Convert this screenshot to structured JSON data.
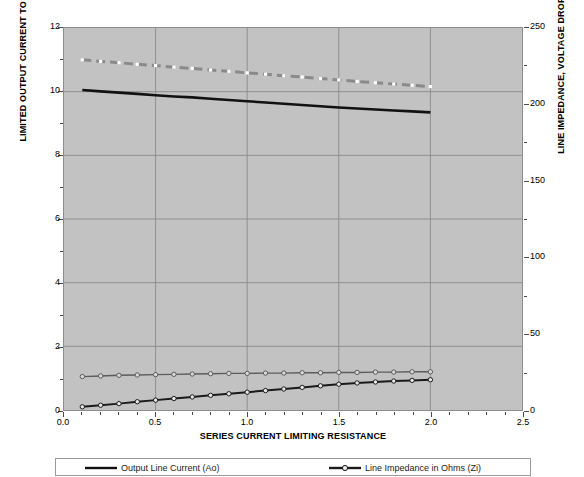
{
  "chart_data": {
    "type": "line",
    "title": "",
    "xlabel": "SERIES CURRENT LIMITING  RESISTANCE",
    "ylabel": "LIMITED OUTPUT CURRENT TO LOAD IN AMPERES",
    "ylabel_right": "LINE IMPEDANCE, VOLTAGE DROP AND LOAD VOLTAGE",
    "xlim": [
      0.0,
      2.5
    ],
    "ylim": [
      0,
      12
    ],
    "ylim_right": [
      0,
      250
    ],
    "grid": true,
    "legend_position": "bottom",
    "background_color": "#c2c2c2",
    "xticks": [
      "0.0",
      "0.5",
      "1.0",
      "1.5",
      "2.0",
      "2.5"
    ],
    "xtick_values": [
      0.0,
      0.5,
      1.0,
      1.5,
      2.0,
      2.5
    ],
    "yticks_left": [
      "0",
      "2",
      "4",
      "6",
      "8",
      "10",
      "12"
    ],
    "ytick_values_left": [
      0,
      2,
      4,
      6,
      8,
      10,
      12
    ],
    "yticks_right": [
      "0",
      "50",
      "100",
      "150",
      "200",
      "250"
    ],
    "ytick_values_right": [
      0,
      50,
      100,
      150,
      200,
      250
    ],
    "x": [
      0.1,
      0.2,
      0.3,
      0.4,
      0.5,
      0.6,
      0.7,
      0.8,
      0.9,
      1.0,
      1.1,
      1.2,
      1.3,
      1.4,
      1.5,
      1.6,
      1.7,
      1.8,
      1.9,
      2.0
    ],
    "series": [
      {
        "name": "Load Voltage",
        "color": "#8a8a8a",
        "style": "dashed",
        "marker": "square",
        "marker_color": "#ffffff",
        "width": 3.0,
        "axis": "left",
        "values": [
          11.0,
          10.95,
          10.91,
          10.86,
          10.82,
          10.77,
          10.73,
          10.68,
          10.64,
          10.59,
          10.55,
          10.5,
          10.46,
          10.41,
          10.37,
          10.32,
          10.28,
          10.24,
          10.2,
          10.16
        ]
      },
      {
        "name": "Output Line Current (Ao)",
        "color": "#111111",
        "style": "solid",
        "marker": "none",
        "marker_color": "#111111",
        "width": 2.6,
        "axis": "left",
        "values": [
          10.05,
          10.01,
          9.97,
          9.93,
          9.89,
          9.85,
          9.82,
          9.78,
          9.74,
          9.7,
          9.66,
          9.62,
          9.58,
          9.54,
          9.5,
          9.47,
          9.44,
          9.41,
          9.38,
          9.35
        ]
      },
      {
        "name": "Voltage Drop",
        "color": "#5c5c5c",
        "style": "solid",
        "marker": "circle",
        "marker_color": "#d9d9d9",
        "width": 1.4,
        "axis": "left",
        "values": [
          1.05,
          1.07,
          1.09,
          1.1,
          1.11,
          1.12,
          1.13,
          1.14,
          1.15,
          1.15,
          1.16,
          1.16,
          1.17,
          1.17,
          1.18,
          1.18,
          1.19,
          1.19,
          1.2,
          1.2
        ]
      },
      {
        "name": "Line Impedance in Ohms (Zi)",
        "color": "#1a1a1a",
        "style": "solid",
        "marker": "circle",
        "marker_color": "#e8e8e8",
        "width": 2.0,
        "axis": "left",
        "values": [
          0.1,
          0.15,
          0.2,
          0.26,
          0.31,
          0.36,
          0.41,
          0.46,
          0.51,
          0.56,
          0.61,
          0.66,
          0.71,
          0.76,
          0.81,
          0.85,
          0.88,
          0.91,
          0.93,
          0.95
        ]
      }
    ],
    "legend": [
      {
        "label": "Output Line Current (Ao)",
        "color": "#111111",
        "style": "solid",
        "marker": "none",
        "marker_color": "#111111"
      },
      {
        "label": "Line Impedance in Ohms (Zi)",
        "color": "#1a1a1a",
        "style": "solid",
        "marker": "circle",
        "marker_color": "#e8e8e8"
      }
    ]
  }
}
